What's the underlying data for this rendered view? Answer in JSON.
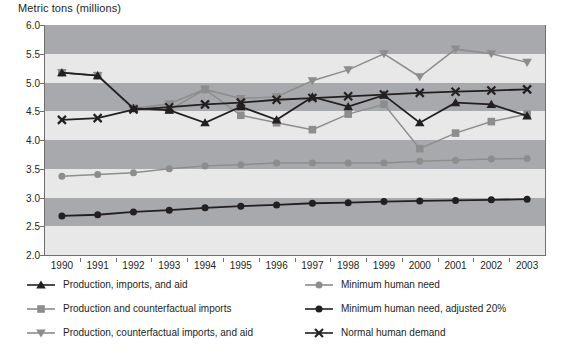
{
  "axis_title": "Metric tons (millions)",
  "chart_data": {
    "type": "line",
    "title": "",
    "xlabel": "",
    "ylabel": "Metric tons (millions)",
    "ylim": [
      2.0,
      6.0
    ],
    "ytick_step": 0.5,
    "yticks": [
      "6.0",
      "5.5",
      "5.0",
      "4.5",
      "4.0",
      "3.5",
      "3.0",
      "2.5",
      "2.0"
    ],
    "grid": false,
    "banded_background": true,
    "legend_position": "bottom",
    "categories": [
      "1990",
      "1991",
      "1992",
      "1993",
      "1994",
      "1995",
      "1996",
      "1997",
      "1998",
      "1999",
      "2000",
      "2001",
      "2002",
      "2003"
    ],
    "series": [
      {
        "name": "Production, imports, and aid",
        "marker": "triangle-up",
        "color": "#231f20",
        "values": [
          5.17,
          5.12,
          4.55,
          4.52,
          4.3,
          4.58,
          4.35,
          4.75,
          4.58,
          4.78,
          4.3,
          4.65,
          4.62,
          4.42
        ]
      },
      {
        "name": "Production and counterfactual imports",
        "marker": "square",
        "color": "#8d8d8d",
        "values": [
          5.17,
          5.12,
          4.55,
          4.52,
          4.88,
          4.43,
          4.3,
          4.18,
          4.45,
          4.62,
          3.85,
          4.12,
          4.32,
          4.45
        ]
      },
      {
        "name": "Production, counterfactual imports, and aid",
        "marker": "triangle-down",
        "color": "#8d8d8d",
        "values": [
          5.17,
          5.12,
          4.55,
          4.63,
          4.88,
          4.72,
          4.75,
          5.03,
          5.22,
          5.5,
          5.1,
          5.58,
          5.5,
          5.35
        ]
      },
      {
        "name": "Minimum human need",
        "marker": "circle",
        "color": "#8d8d8d",
        "values": [
          3.37,
          3.4,
          3.43,
          3.5,
          3.55,
          3.57,
          3.6,
          3.6,
          3.6,
          3.6,
          3.63,
          3.65,
          3.67,
          3.68
        ]
      },
      {
        "name": "Minimum human need, adjusted 20%",
        "marker": "circle-filled",
        "color": "#231f20",
        "values": [
          2.68,
          2.7,
          2.75,
          2.78,
          2.82,
          2.85,
          2.87,
          2.9,
          2.91,
          2.93,
          2.94,
          2.95,
          2.96,
          2.97
        ]
      },
      {
        "name": "Normal human demand",
        "marker": "x-cross",
        "color": "#231f20",
        "values": [
          4.35,
          4.38,
          4.53,
          4.57,
          4.62,
          4.65,
          4.7,
          4.73,
          4.76,
          4.79,
          4.82,
          4.84,
          4.86,
          4.88
        ]
      }
    ]
  },
  "colors": {
    "band_dark": "#a7a9ac",
    "band_light": "#e8e8e8",
    "axis": "#6f6f6f",
    "text": "#231f20",
    "dark_series": "#231f20",
    "gray_series": "#8d8d8d"
  },
  "legend": {
    "items": [
      {
        "label": "Production, imports, and aid",
        "marker": "triangle-up",
        "color": "#231f20"
      },
      {
        "label": "Production and counterfactual imports",
        "marker": "square",
        "color": "#8d8d8d"
      },
      {
        "label": "Production, counterfactual imports, and aid",
        "marker": "triangle-down",
        "color": "#8d8d8d"
      },
      {
        "label": "Minimum human need",
        "marker": "circle",
        "color": "#8d8d8d"
      },
      {
        "label": "Minimum human need, adjusted 20%",
        "marker": "circle-filled",
        "color": "#231f20"
      },
      {
        "label": "Normal human demand",
        "marker": "x-cross",
        "color": "#231f20"
      }
    ]
  }
}
